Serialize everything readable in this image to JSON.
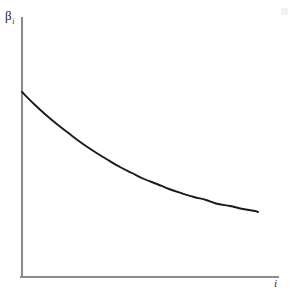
{
  "chart_data": {
    "type": "line",
    "title": "",
    "subtitle": "",
    "xlabel": "i",
    "ylabel": "β",
    "ylabel_subscript": "i",
    "grid": false,
    "legend": null,
    "annotations": [],
    "axis": {
      "x_origin_px": 22,
      "y_origin_px": 277,
      "x_end_px": 278,
      "y_top_px": 18,
      "color": "#8c8c8c",
      "arrowheads": false,
      "ticks": [],
      "tick_labels": []
    },
    "xlim": [
      0,
      1
    ],
    "ylim": [
      0,
      1
    ],
    "series": [
      {
        "name": "beta_i",
        "description": "monotonically decreasing convex decay curve",
        "color": "#1a1a1a",
        "x": [
          0.0,
          0.05,
          0.1,
          0.15,
          0.2,
          0.25,
          0.3,
          0.35,
          0.4,
          0.45,
          0.5,
          0.55,
          0.6,
          0.65,
          0.7,
          0.75,
          0.8,
          0.85,
          0.9,
          0.95,
          1.0
        ],
        "y": [
          0.715,
          0.65,
          0.59,
          0.535,
          0.484,
          0.437,
          0.394,
          0.354,
          0.318,
          0.285,
          0.255,
          0.227,
          0.202,
          0.179,
          0.159,
          0.14,
          0.123,
          0.108,
          0.094,
          0.082,
          0.071
        ],
        "points_px": [
          [
            22,
            92
          ],
          [
            34,
            104
          ],
          [
            46,
            115
          ],
          [
            58,
            125
          ],
          [
            71,
            135
          ],
          [
            83,
            144
          ],
          [
            95,
            152
          ],
          [
            108,
            160
          ],
          [
            120,
            167
          ],
          [
            132,
            173
          ],
          [
            144,
            179
          ],
          [
            157,
            184
          ],
          [
            169,
            189
          ],
          [
            181,
            193
          ],
          [
            194,
            197
          ],
          [
            206,
            200
          ],
          [
            218,
            204
          ],
          [
            230,
            206
          ],
          [
            243,
            209
          ],
          [
            255,
            211
          ],
          [
            258,
            212
          ]
        ]
      }
    ]
  },
  "labels": {
    "y_axis": "β",
    "y_axis_subscript": "i",
    "x_axis": "i"
  },
  "colors": {
    "background": "#ffffff",
    "curve": "#1a1a1a",
    "axis": "#8c8c8c",
    "artifact": "#f2f2f2"
  }
}
